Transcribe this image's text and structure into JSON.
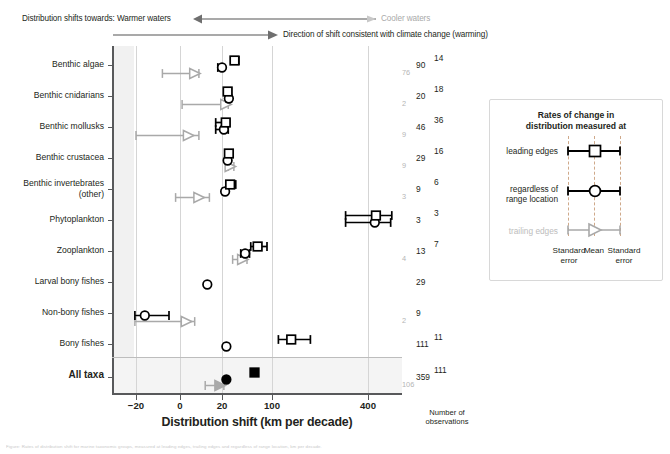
{
  "header": {
    "shift_label": "Distribution shifts towards: Warmer waters",
    "cooler_label": "Cooler waters",
    "direction_label": "Direction of shift consistent with climate change (warming)"
  },
  "axes": {
    "xlabel": "Distribution shift (km per decade)",
    "xticks": [
      "−20",
      "0",
      "20",
      "100",
      "400"
    ],
    "xtick_values": [
      -20,
      0,
      20,
      100,
      400
    ],
    "obs_title_line1": "Number of",
    "obs_title_line2": "observations"
  },
  "legend": {
    "title_line1": "Rates of change in",
    "title_line2": "distribution measured at",
    "rows": [
      {
        "label": "leading edges",
        "marker": "square",
        "muted": false
      },
      {
        "label": "regardless of\nrange location",
        "marker": "circle",
        "muted": false
      },
      {
        "label": "trailing edges",
        "marker": "triangle",
        "muted": true
      }
    ],
    "foot_left_line1": "Standard",
    "foot_left_line2": "error",
    "foot_mid": "Mean",
    "foot_right_line1": "Standard",
    "foot_right_line2": "error"
  },
  "caption": "Figure: Rates of distribution shift for marine taxonomic groups, measured at leading edges, trailing edges and regardless of range location, km per decade.",
  "chart_data": {
    "type": "scatter",
    "title": "",
    "xlabel": "Distribution shift (km per decade)",
    "ylabel": "",
    "xticks": [
      -20,
      0,
      20,
      100,
      400
    ],
    "xscale": "piecewise-compressed",
    "grid": true,
    "legend_position": "right",
    "series": [
      {
        "name": "leading edges",
        "marker": "square",
        "color": "#000000"
      },
      {
        "name": "regardless of range location",
        "marker": "circle",
        "color": "#000000"
      },
      {
        "name": "trailing edges",
        "marker": "triangle",
        "color": "#a6a6a6"
      }
    ],
    "categories": [
      "Benthic algae",
      "Benthic cnidarians",
      "Benthic mollusks",
      "Benthic crustacea",
      "Benthic invertebrates (other)",
      "Phytoplankton",
      "Zooplankton",
      "Larval bony fishes",
      "Non-bony fishes",
      "Bony fishes",
      "All taxa"
    ],
    "rows": [
      {
        "category": "Benthic algae",
        "square": {
          "mean": 40.0,
          "lo": 34.0,
          "hi": 47.0,
          "n": 14
        },
        "circle": {
          "mean": 20.0,
          "lo": 18.0,
          "hi": 22.0,
          "n": 90
        },
        "triangle": {
          "mean": 7.0,
          "lo": -8.0,
          "hi": 9.0,
          "n": 76
        }
      },
      {
        "category": "Benthic cnidarians",
        "square": {
          "mean": 29.0,
          "lo": 26.0,
          "hi": 35.0,
          "n": 18
        },
        "circle": {
          "mean": 31.0,
          "lo": 27.0,
          "hi": 35.0,
          "n": 20
        },
        "triangle": {
          "mean": 26.0,
          "lo": 1.0,
          "hi": 30.0,
          "n": 2
        }
      },
      {
        "category": "Benthic mollusks",
        "square": {
          "mean": 26.0,
          "lo": 17.0,
          "hi": 32.0,
          "n": 36
        },
        "circle": {
          "mean": 23.0,
          "lo": 17.0,
          "hi": 30.0,
          "n": 46
        },
        "triangle": {
          "mean": 4.0,
          "lo": -20.0,
          "hi": 9.0,
          "n": 9
        }
      },
      {
        "category": "Benthic crustacea",
        "square": {
          "mean": 31.0,
          "lo": 28.0,
          "hi": 36.0,
          "n": 16
        },
        "circle": {
          "mean": 29.0,
          "lo": 27.0,
          "hi": 32.0,
          "n": 29
        },
        "triangle": {
          "mean": 33.0,
          "lo": 30.0,
          "hi": 39.0,
          "n": 9
        }
      },
      {
        "category": "Benthic invertebrates (other)",
        "square": {
          "mean": 33.0,
          "lo": 28.0,
          "hi": 42.0,
          "n": 6
        },
        "circle": {
          "mean": 25.0,
          "lo": 21.0,
          "hi": 28.0,
          "n": 9
        },
        "triangle": {
          "mean": 9.0,
          "lo": -2.0,
          "hi": 14.0,
          "n": 3
        }
      },
      {
        "category": "Phytoplankton",
        "square": {
          "mean": 470.0,
          "lo": 330.0,
          "hi": 610.0,
          "n": 3
        },
        "circle": {
          "mean": 460.0,
          "lo": 330.0,
          "hi": 600.0,
          "n": 3
        },
        "triangle": null
      },
      {
        "category": "Zooplankton",
        "square": {
          "mean": 77.0,
          "lo": 66.0,
          "hi": 92.0,
          "n": 7
        },
        "circle": {
          "mean": 57.0,
          "lo": 50.0,
          "hi": 64.0,
          "n": 13
        },
        "triangle": {
          "mean": 53.0,
          "lo": 37.0,
          "hi": 60.0,
          "n": 4
        }
      },
      {
        "category": "Larval bony fishes",
        "square": null,
        "circle": {
          "mean": 13.0,
          "lo": 13.0,
          "hi": 13.0,
          "n": 29
        },
        "triangle": null
      },
      {
        "category": "Non-bony fishes",
        "square": null,
        "circle": {
          "mean": -16.0,
          "lo": -21.0,
          "hi": -5.0,
          "n": 9
        },
        "triangle": {
          "mean": 3.0,
          "lo": -21.0,
          "hi": 7.0,
          "n": 2
        }
      },
      {
        "category": "Bony fishes",
        "square": {
          "mean": 160.0,
          "lo": 120.0,
          "hi": 220.0,
          "n": 11
        },
        "circle": {
          "mean": 27.0,
          "lo": 24.0,
          "hi": 30.0,
          "n": 111
        },
        "triangle": null
      },
      {
        "category": "All taxa",
        "square": {
          "mean": 72.0,
          "lo": 72.0,
          "hi": 72.0,
          "n": 111
        },
        "circle": {
          "mean": 27.0,
          "lo": 26.0,
          "hi": 28.0,
          "n": 359
        },
        "triangle": {
          "mean": 19.0,
          "lo": 12.0,
          "hi": 23.0,
          "n": 106
        }
      }
    ]
  }
}
